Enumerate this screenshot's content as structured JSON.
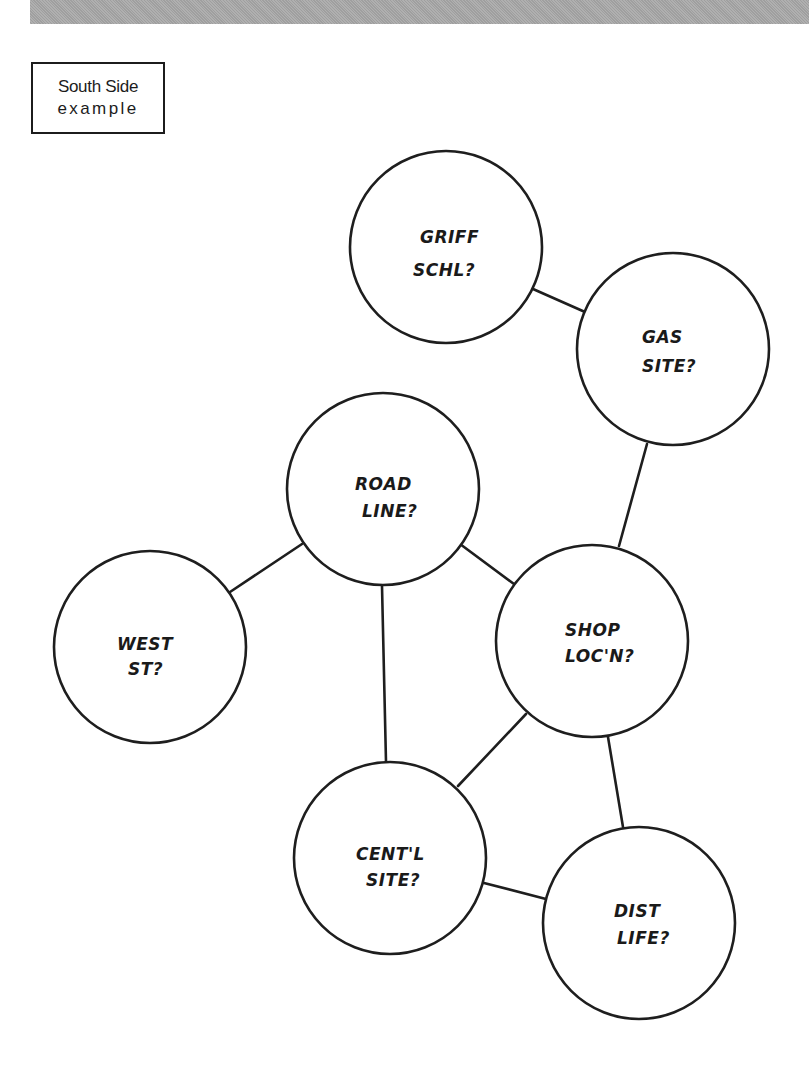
{
  "header": {
    "band_color": "#a9a9a9"
  },
  "label": {
    "line1": "South Side",
    "line2": "example"
  },
  "diagram": {
    "stroke_color": "#1e1e1e",
    "nodes": [
      {
        "id": "griff",
        "line1": "GRIFF",
        "line2": "SCHL?",
        "cx": 446,
        "cy": 247,
        "r": 96
      },
      {
        "id": "gas",
        "line1": "GAS",
        "line2": "SITE?",
        "cx": 673,
        "cy": 349,
        "r": 96
      },
      {
        "id": "road",
        "line1": "ROAD",
        "line2": "LINE?",
        "cx": 383,
        "cy": 489,
        "r": 96
      },
      {
        "id": "west",
        "line1": "WEST",
        "line2": "ST?",
        "cx": 150,
        "cy": 647,
        "r": 96
      },
      {
        "id": "shop",
        "line1": "SHOP",
        "line2": "LOC'N?",
        "cx": 592,
        "cy": 641,
        "r": 96
      },
      {
        "id": "centl",
        "line1": "CENT'L",
        "line2": "SITE?",
        "cx": 390,
        "cy": 858,
        "r": 96
      },
      {
        "id": "dist",
        "line1": "DIST",
        "line2": "LIFE?",
        "cx": 639,
        "cy": 923,
        "r": 96
      }
    ],
    "edges": [
      {
        "from": "griff",
        "to": "gas"
      },
      {
        "from": "gas",
        "to": "shop"
      },
      {
        "from": "road",
        "to": "west"
      },
      {
        "from": "road",
        "to": "shop"
      },
      {
        "from": "road",
        "to": "centl"
      },
      {
        "from": "shop",
        "to": "centl"
      },
      {
        "from": "shop",
        "to": "dist"
      },
      {
        "from": "centl",
        "to": "dist"
      }
    ]
  }
}
